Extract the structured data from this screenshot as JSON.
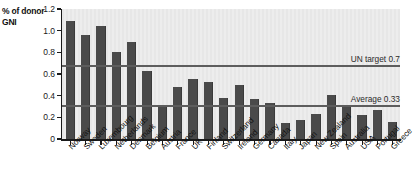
{
  "chart_data": {
    "type": "bar",
    "title": "",
    "ylabel": "% of donor GNI",
    "xlabel": "",
    "ylim": [
      0,
      1.2
    ],
    "yticks": [
      "0",
      "0.2",
      "0.4",
      "0.6",
      "0.8",
      "1.0",
      "1.2"
    ],
    "ytick_values": [
      0,
      0.2,
      0.4,
      0.6,
      0.8,
      1.0,
      1.2
    ],
    "grid": false,
    "legend": "none",
    "bar_color": "#4a4a4a",
    "plot_background": "#e9e9e9",
    "categories": [
      "Norway",
      "Sweden",
      "Luxembourg",
      "Netherlands",
      "Denmark",
      "Belgium",
      "Austria",
      "France",
      "UK",
      "Finland",
      "Switzerland",
      "Ireland",
      "Germany",
      "Canada",
      "Italy",
      "Japan",
      "New Zealand",
      "Spain",
      "Australia",
      "USA",
      "Portugal",
      "Greece"
    ],
    "values": [
      1.09,
      0.96,
      1.04,
      0.8,
      0.9,
      0.63,
      0.3,
      0.48,
      0.55,
      0.53,
      0.38,
      0.5,
      0.37,
      0.33,
      0.15,
      0.18,
      0.23,
      0.41,
      0.3,
      0.22,
      0.27,
      0.16
    ],
    "reference_lines": [
      {
        "label": "UN target 0.7",
        "value": 0.68,
        "color": "#5d5d5d"
      },
      {
        "label": "Average 0.33",
        "value": 0.31,
        "color": "#5d5d5d"
      }
    ]
  }
}
